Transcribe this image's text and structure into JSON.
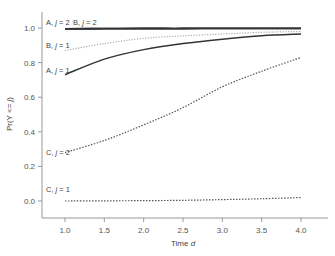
{
  "chart_data": {
    "type": "line",
    "title": "",
    "xlabel": "Time d",
    "xlabel_parts": {
      "text": "Time ",
      "italic": "d"
    },
    "ylabel": "Pr(Y <= j)",
    "ylabel_parts": {
      "prefix": "Pr(Y <= ",
      "italic": "j",
      "suffix": ")"
    },
    "xlim": [
      1.0,
      4.0
    ],
    "ylim": [
      0.0,
      1.0
    ],
    "xticks": [
      "1.0",
      "1.5",
      "2.0",
      "2.5",
      "3.0",
      "3.5",
      "4.0"
    ],
    "yticks": [
      "0.0",
      "0.2",
      "0.4",
      "0.6",
      "0.8",
      "1.0"
    ],
    "grid": false,
    "legend": "none (inline curve labels)",
    "x": [
      1.0,
      1.5,
      2.0,
      2.5,
      3.0,
      3.5,
      4.0
    ],
    "series": [
      {
        "name": "A, j = 2",
        "label_prefix": "A, ",
        "label_j": "j",
        "label_suffix": " = 2",
        "style": "solid-thick",
        "values": [
          0.995,
          0.996,
          0.997,
          0.997,
          0.998,
          0.998,
          0.998
        ]
      },
      {
        "name": "B, j = 2",
        "label_prefix": "B, ",
        "label_j": "j",
        "label_suffix": " = 2",
        "style": "solid-thick",
        "values": [
          0.995,
          0.996,
          0.997,
          0.997,
          0.998,
          0.998,
          0.998
        ]
      },
      {
        "name": "B, j = 1",
        "label_prefix": "B, ",
        "label_j": "j",
        "label_suffix": " = 1",
        "style": "dotted-light",
        "values": [
          0.87,
          0.91,
          0.94,
          0.955,
          0.965,
          0.975,
          0.98
        ]
      },
      {
        "name": "A, j = 1",
        "label_prefix": "A, ",
        "label_j": "j",
        "label_suffix": " = 1",
        "style": "solid",
        "values": [
          0.73,
          0.82,
          0.875,
          0.91,
          0.935,
          0.955,
          0.965
        ]
      },
      {
        "name": "C, j = 2",
        "label_prefix": "C, ",
        "label_j": "j",
        "label_suffix": " = 2",
        "style": "dotted",
        "values": [
          0.28,
          0.35,
          0.44,
          0.54,
          0.66,
          0.75,
          0.83
        ]
      },
      {
        "name": "C, j = 1",
        "label_prefix": "C, ",
        "label_j": "j",
        "label_suffix": " = 1",
        "style": "dotted",
        "values": [
          0.0,
          0.001,
          0.002,
          0.004,
          0.008,
          0.013,
          0.02
        ]
      }
    ]
  }
}
